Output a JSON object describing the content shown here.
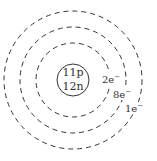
{
  "diagram": {
    "nucleus": {
      "protons_label": "11p",
      "neutrons_label": "12n"
    },
    "shells": [
      {
        "label": "2e",
        "charge": "−"
      },
      {
        "label": "8e",
        "charge": "−"
      },
      {
        "label": "1e",
        "charge": "−"
      }
    ],
    "colors": {
      "stroke": "#333333",
      "background": "#ffffff"
    }
  }
}
